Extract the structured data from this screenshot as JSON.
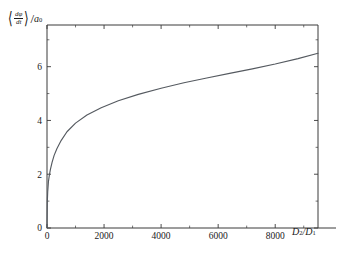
{
  "chart_data": {
    "type": "line",
    "title": "",
    "subtitle": "",
    "xlabel": "D_2/D_1",
    "ylabel": "<dphi/dt>/a_0",
    "xlabel_parts": {
      "main1": "D",
      "sub1": "2",
      "slash": "/",
      "main2": "D",
      "sub2": "1"
    },
    "ylabel_parts": {
      "open_bracket": "⟨",
      "numerator": "dφ",
      "denominator": "dt",
      "close_bracket": "⟩",
      "divider": "/",
      "scale": "a",
      "scale_sub": "0"
    },
    "xlim": [
      0,
      9500
    ],
    "ylim": [
      0,
      7.55
    ],
    "xticks": [
      0,
      2000,
      4000,
      6000,
      8000
    ],
    "xticklabels": [
      "0",
      "2000",
      "4000",
      "6000",
      "8000"
    ],
    "xminorticks": [
      1000,
      3000,
      5000,
      7000,
      9000
    ],
    "yticks": [
      0,
      2,
      4,
      6
    ],
    "yticklabels": [
      "0",
      "2",
      "4",
      "6"
    ],
    "yminorticks": [
      1,
      3,
      5,
      7
    ],
    "grid": false,
    "legend": "none",
    "line_color": "#555a60",
    "axis_color": "#3a3a3a",
    "background": "#ffffff",
    "x": [
      0,
      10,
      25,
      50,
      80,
      120,
      180,
      250,
      350,
      500,
      700,
      1000,
      1400,
      1900,
      2500,
      3200,
      4000,
      4800,
      5600,
      6400,
      7200,
      8000,
      8800,
      9500
    ],
    "values": [
      0.0,
      0.95,
      1.35,
      1.72,
      1.95,
      2.18,
      2.45,
      2.7,
      2.96,
      3.26,
      3.58,
      3.9,
      4.2,
      4.47,
      4.73,
      4.97,
      5.2,
      5.4,
      5.58,
      5.75,
      5.92,
      6.1,
      6.3,
      6.5
    ],
    "series": [
      {
        "name": "mean phase velocity",
        "x": [
          0,
          10,
          25,
          50,
          80,
          120,
          180,
          250,
          350,
          500,
          700,
          1000,
          1400,
          1900,
          2500,
          3200,
          4000,
          4800,
          5600,
          6400,
          7200,
          8000,
          8800,
          9500
        ],
        "values": [
          0.0,
          0.95,
          1.35,
          1.72,
          1.95,
          2.18,
          2.45,
          2.7,
          2.96,
          3.26,
          3.58,
          3.9,
          4.2,
          4.47,
          4.73,
          4.97,
          5.2,
          5.4,
          5.58,
          5.75,
          5.92,
          6.1,
          6.3,
          6.5
        ]
      }
    ],
    "annotations": []
  },
  "figure": {
    "frame": {
      "left": 47,
      "right": 318,
      "top": 25,
      "bottom": 228
    }
  }
}
